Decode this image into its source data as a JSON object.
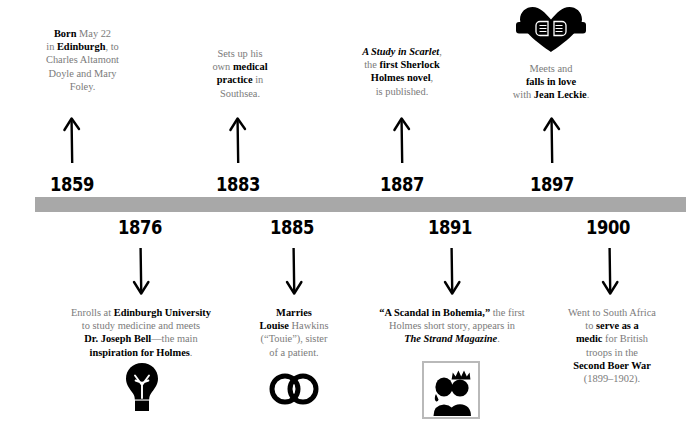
{
  "graphic": {
    "type": "timeline-infographic",
    "subject": "Arthur Conan Doyle life timeline",
    "bar_color": "#a8a8a8",
    "text_color": "#7b7b7b",
    "emphasis_color": "#000000"
  },
  "events_above": [
    {
      "year": "1859",
      "icon": null,
      "lines": [
        [
          {
            "t": "Born",
            "s": "bold"
          },
          {
            "t": " May 22",
            "s": "plain"
          }
        ],
        [
          {
            "t": "in ",
            "s": "plain"
          },
          {
            "t": "Edinburgh",
            "s": "bold"
          },
          {
            "t": ", to",
            "s": "plain"
          }
        ],
        [
          {
            "t": "Charles Altamont",
            "s": "plain"
          }
        ],
        [
          {
            "t": "Doyle and Mary",
            "s": "plain"
          }
        ],
        [
          {
            "t": "Foley.",
            "s": "plain"
          }
        ]
      ]
    },
    {
      "year": "1883",
      "icon": null,
      "lines": [
        [
          {
            "t": "Sets up his",
            "s": "plain"
          }
        ],
        [
          {
            "t": "own ",
            "s": "plain"
          },
          {
            "t": "medical",
            "s": "bold"
          }
        ],
        [
          {
            "t": "practice",
            "s": "bold"
          },
          {
            "t": " in",
            "s": "plain"
          }
        ],
        [
          {
            "t": "Southsea.",
            "s": "plain"
          }
        ]
      ]
    },
    {
      "year": "1887",
      "icon": null,
      "lines": [
        [
          {
            "t": "A Study in Scarlet",
            "s": "bold-italic"
          },
          {
            "t": ",",
            "s": "plain"
          }
        ],
        [
          {
            "t": "the ",
            "s": "plain"
          },
          {
            "t": "first Sherlock",
            "s": "bold"
          }
        ],
        [
          {
            "t": "Holmes novel",
            "s": "bold"
          },
          {
            "t": ",",
            "s": "plain"
          }
        ],
        [
          {
            "t": "is published.",
            "s": "plain"
          }
        ]
      ]
    },
    {
      "year": "1897",
      "icon": "heart-handshake-icon",
      "lines": [
        [
          {
            "t": "Meets and",
            "s": "plain"
          }
        ],
        [
          {
            "t": "falls in love",
            "s": "bold"
          }
        ],
        [
          {
            "t": "with ",
            "s": "plain"
          },
          {
            "t": "Jean Leckie",
            "s": "bold"
          },
          {
            "t": ".",
            "s": "plain"
          }
        ]
      ]
    }
  ],
  "events_below": [
    {
      "year": "1876",
      "icon": "lightbulb-icon",
      "lines": [
        [
          {
            "t": "Enrolls at ",
            "s": "plain"
          },
          {
            "t": "Edinburgh University",
            "s": "bold"
          }
        ],
        [
          {
            "t": "to study medicine and meets",
            "s": "plain"
          }
        ],
        [
          {
            "t": "Dr. Joseph Bell",
            "s": "bold"
          },
          {
            "t": "—the main",
            "s": "plain"
          }
        ],
        [
          {
            "t": "inspiration for Holmes",
            "s": "bold"
          },
          {
            "t": ".",
            "s": "plain"
          }
        ]
      ]
    },
    {
      "year": "1885",
      "icon": "wedding-rings-icon",
      "lines": [
        [
          {
            "t": "Marries",
            "s": "bold"
          }
        ],
        [
          {
            "t": "Louise",
            "s": "bold"
          },
          {
            "t": " Hawkins",
            "s": "plain"
          }
        ],
        [
          {
            "t": "(“Touie”), sister",
            "s": "plain"
          }
        ],
        [
          {
            "t": "of a patient.",
            "s": "plain"
          }
        ]
      ]
    },
    {
      "year": "1891",
      "icon": "framed-portrait-icon",
      "lines": [
        [
          {
            "t": "“A Scandal in Bohemia,”",
            "s": "bold"
          },
          {
            "t": " the first",
            "s": "plain"
          }
        ],
        [
          {
            "t": "Holmes short story, appears in",
            "s": "plain"
          }
        ],
        [
          {
            "t": "The Strand Magazine",
            "s": "bold-italic"
          },
          {
            "t": ".",
            "s": "plain"
          }
        ]
      ]
    },
    {
      "year": "1900",
      "icon": null,
      "lines": [
        [
          {
            "t": "Went to South Africa",
            "s": "plain"
          }
        ],
        [
          {
            "t": "to ",
            "s": "plain"
          },
          {
            "t": "serve as a",
            "s": "bold"
          }
        ],
        [
          {
            "t": "medic",
            "s": "bold"
          },
          {
            "t": " for British",
            "s": "plain"
          }
        ],
        [
          {
            "t": "troops in the",
            "s": "plain"
          }
        ],
        [
          {
            "t": "Second Boer War",
            "s": "bold"
          }
        ],
        [
          {
            "t": "(1899–1902).",
            "s": "plain"
          }
        ]
      ]
    }
  ]
}
